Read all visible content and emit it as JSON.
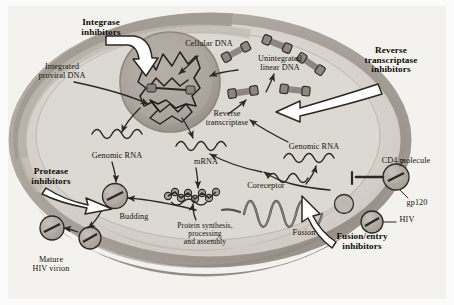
{
  "figure": {
    "background_color": "#fbfbfb",
    "palette": {
      "cell_outer_membrane": "#a9a29c",
      "cytoplasm_light": "#dedad5",
      "cytoplasm_mid": "#c9c3bd",
      "cytoplasm_dark": "#9d9790",
      "nucleus_fill": "#a8a29b",
      "nucleus_inner": "#b8b2ab",
      "stroke_dark": "#2b2723",
      "virion_fill": "#b6b0a9",
      "dna_segment": "#8d8780",
      "paper": "#f2f0ec"
    }
  },
  "drug_classes": [
    {
      "id": "integrase-inhibitors",
      "label": "Integrase\ninhibitors",
      "x": 62,
      "y": 18,
      "width": 78
    },
    {
      "id": "reverse-transcriptase-inhibitors",
      "label": "Reverse\ntranscriptase\ninhibitors",
      "x": 348,
      "y": 46,
      "width": 86
    },
    {
      "id": "protease-inhibitors",
      "label": "Protease\ninhibitors",
      "x": 14,
      "y": 167,
      "width": 74
    },
    {
      "id": "fusion-entry-inhibitors",
      "label": "Fusion/entry\ninhibitors",
      "x": 320,
      "y": 232,
      "width": 84
    }
  ],
  "structures": [
    {
      "id": "cellular-dna",
      "label": "Cellular DNA",
      "x": 174,
      "y": 40,
      "width": 70
    },
    {
      "id": "integrated-proviral-dna",
      "label": "Integrated\nproviral DNA",
      "x": 24,
      "y": 63,
      "width": 76
    },
    {
      "id": "unintegrated-linear-dna",
      "label": "Unintegrated\nlinear DNA",
      "x": 245,
      "y": 55,
      "width": 70
    },
    {
      "id": "reverse-transcriptase",
      "label": "Reverse\ntranscriptase",
      "x": 192,
      "y": 110,
      "width": 70
    },
    {
      "id": "genomic-rna-left",
      "label": "Genomic RNA",
      "x": 80,
      "y": 152,
      "width": 74
    },
    {
      "id": "mrna",
      "label": "mRNA",
      "x": 185,
      "y": 158,
      "width": 42
    },
    {
      "id": "genomic-rna-right",
      "label": "Genomic RNA",
      "x": 277,
      "y": 143,
      "width": 74
    },
    {
      "id": "cd4-molecule",
      "label": "CD4 molecule",
      "x": 368,
      "y": 157,
      "width": 76
    },
    {
      "id": "gp120",
      "label": "gp120",
      "x": 398,
      "y": 199,
      "width": 38
    },
    {
      "id": "hiv",
      "label": "HIV",
      "x": 394,
      "y": 222,
      "width": 26
    },
    {
      "id": "coreceptor",
      "label": "Coreceptor",
      "x": 237,
      "y": 182,
      "width": 58
    },
    {
      "id": "budding",
      "label": "Budding",
      "x": 110,
      "y": 213,
      "width": 48
    },
    {
      "id": "fusion",
      "label": "Fusion",
      "x": 285,
      "y": 229,
      "width": 38
    },
    {
      "id": "protein-synthesis",
      "label": "Protein synthesis,\nprocessing\nand assembly",
      "x": 155,
      "y": 222,
      "width": 100
    },
    {
      "id": "mature-hiv-virion",
      "label": "Mature\nHIV virion",
      "x": 20,
      "y": 256,
      "width": 62
    }
  ]
}
